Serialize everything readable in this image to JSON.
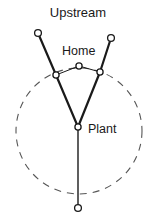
{
  "figure": {
    "title": "Upstream",
    "labels": {
      "home": "Home",
      "plant": "Plant"
    },
    "background_color": "#ffffff",
    "stroke_color": "#1a1a1a",
    "dashed_color": "#555555",
    "node_fill": "#ffffff"
  },
  "chart_data": {
    "type": "scatter",
    "title": "Upstream",
    "xlabel": "",
    "ylabel": "",
    "xlim": [
      0,
      156
    ],
    "ylim": [
      219,
      0
    ],
    "grid": false,
    "legend": "none",
    "annotations": [
      {
        "text": "Upstream",
        "x": 78,
        "y": 14
      },
      {
        "text": "Home",
        "x": 86,
        "y": 52
      },
      {
        "text": "Plant",
        "x": 103,
        "y": 130
      }
    ],
    "nodes": [
      {
        "name": "upstream-left-tip",
        "x": 38,
        "y": 33,
        "r": 3.4
      },
      {
        "name": "upstream-right-tip",
        "x": 111,
        "y": 38,
        "r": 3.4
      },
      {
        "name": "mid-left",
        "x": 56,
        "y": 75,
        "r": 3.1
      },
      {
        "name": "home",
        "x": 79,
        "y": 66,
        "r": 3.1
      },
      {
        "name": "mid-right",
        "x": 100,
        "y": 72,
        "r": 3.1
      },
      {
        "name": "plant",
        "x": 78,
        "y": 127,
        "r": 3.1
      },
      {
        "name": "downstream-tip",
        "x": 78,
        "y": 208,
        "r": 3.4
      }
    ],
    "edges": [
      {
        "name": "upstream-left-branch",
        "from": "upstream-left-tip",
        "to": "mid-left",
        "style": "solid",
        "width": 2.2
      },
      {
        "name": "upstream-right-branch",
        "from": "upstream-right-tip",
        "to": "mid-right",
        "style": "solid",
        "width": 2.2
      },
      {
        "name": "left-trunk",
        "from": "mid-left",
        "to": "plant",
        "style": "solid",
        "width": 2.2
      },
      {
        "name": "right-trunk",
        "from": "mid-right",
        "to": "plant",
        "style": "solid",
        "width": 2.2
      },
      {
        "name": "home-left-link",
        "from": "mid-left",
        "to": "home",
        "style": "solid",
        "width": 1.0
      },
      {
        "name": "home-right-link",
        "from": "home",
        "to": "mid-right",
        "style": "solid",
        "width": 1.0
      },
      {
        "name": "plant-downstream",
        "from": "plant",
        "to": "downstream-tip",
        "style": "solid",
        "width": 1.4
      }
    ],
    "circle": {
      "name": "range-circle",
      "cx": 79,
      "cy": 131,
      "r": 63,
      "style": "dashed",
      "dash": "7 6",
      "width": 1.1
    }
  }
}
